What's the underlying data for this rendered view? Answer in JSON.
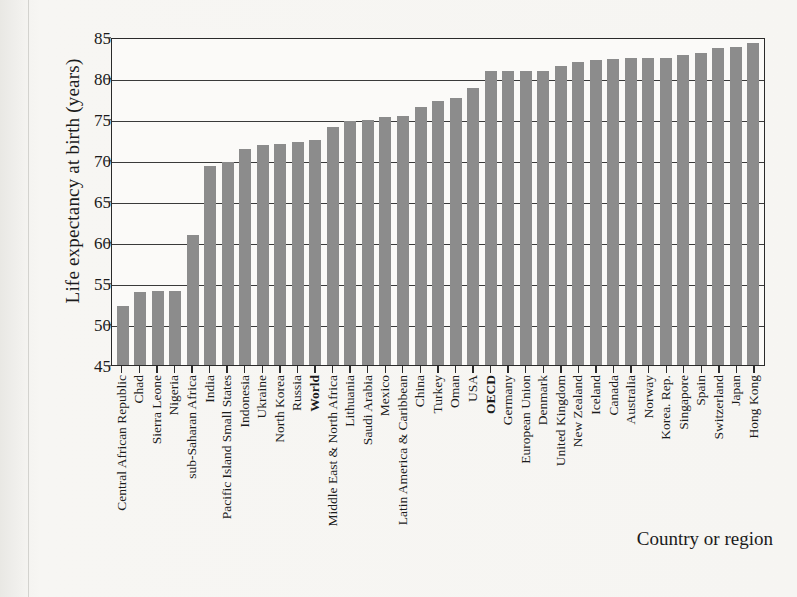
{
  "chart_data": {
    "type": "bar",
    "title": "",
    "xlabel": "Country or region",
    "ylabel": "Life expectancy at birth (years)",
    "ylim": [
      45,
      85
    ],
    "ytick_values": [
      85,
      80,
      75,
      70,
      65,
      60,
      55,
      50,
      45
    ],
    "grid": true,
    "legend": null,
    "bar_color": "#8c8c8c",
    "axis_color": "#2a2a2a",
    "background_color": "#f4f3f0",
    "plot_background_color": "#fbfaf8",
    "categories": [
      "Central African Republic",
      "Chad",
      "Sierra Leone",
      "Nigeria",
      "sub-Saharan Africa",
      "India",
      "Pacific Island Small States",
      "Indonesia",
      "Ukraine",
      "North Korea",
      "Russia",
      "World",
      "Middle East & North Africa",
      "Lithuania",
      "Saudi Arabia",
      "Mexico",
      "Latin America & Caribbean",
      "China",
      "Turkey",
      "Oman",
      "USA",
      "OECD",
      "Germany",
      "European Union",
      "Denmark",
      "United Kingdom",
      "New Zealand",
      "Iceland",
      "Canada",
      "Australia",
      "Norway",
      "Korea. Rep.",
      "Singapore",
      "Spain",
      "Switzerland",
      "Japan",
      "Hong Kong"
    ],
    "emphasized_categories": [
      "World",
      "OECD"
    ],
    "values": [
      52.2,
      53.9,
      54.0,
      54.0,
      60.9,
      69.3,
      69.8,
      71.3,
      71.8,
      72.0,
      72.2,
      72.4,
      74.0,
      74.8,
      74.9,
      75.3,
      75.4,
      76.5,
      77.2,
      77.6,
      78.8,
      80.8,
      80.9,
      80.9,
      80.9,
      81.5,
      81.9,
      82.2,
      82.3,
      82.4,
      82.5,
      82.5,
      82.8,
      83.0,
      83.6,
      83.8,
      84.3
    ]
  }
}
